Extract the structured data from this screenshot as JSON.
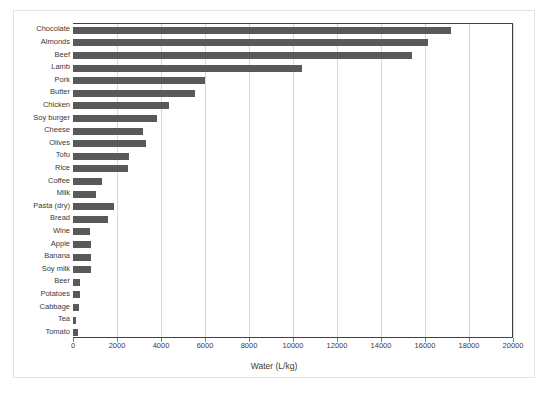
{
  "chart_data": {
    "type": "bar",
    "orientation": "horizontal",
    "title": "",
    "xlabel": "Water (L/kg)",
    "ylabel": "",
    "xlim": [
      0,
      20000
    ],
    "xticks": [
      0,
      2000,
      4000,
      6000,
      8000,
      10000,
      12000,
      14000,
      16000,
      18000,
      20000
    ],
    "xtick_labels": [
      "0",
      "2000",
      "4000",
      "6000",
      "8000",
      "10000",
      "12000",
      "14000",
      "16000",
      "18000",
      "20000"
    ],
    "grid": "vertical",
    "legend": null,
    "bar_color": "#595959",
    "categories": [
      "Chocolate",
      "Almonds",
      "Beef",
      "Lamb",
      "Pork",
      "Butter",
      "Chicken",
      "Soy burger",
      "Cheese",
      "Olives",
      "Tofu",
      "Rice",
      "Coffee",
      "Milk",
      "Pasta (dry)",
      "Bread",
      "Wine",
      "Apple",
      "Banana",
      "Soy milk",
      "Beer",
      "Potatoes",
      "Cabbage",
      "Tea",
      "Tomato"
    ],
    "values": [
      17200,
      16150,
      15400,
      10400,
      6000,
      5550,
      4350,
      3800,
      3200,
      3300,
      2550,
      2500,
      1300,
      1050,
      1850,
      1600,
      750,
      800,
      820,
      820,
      300,
      320,
      290,
      120,
      220
    ]
  },
  "colors": {
    "bar": "#595959",
    "grid": "#d9d9d9",
    "axis": "#404040",
    "text": "#3a3a3a",
    "frame": "#e2e2e2"
  }
}
